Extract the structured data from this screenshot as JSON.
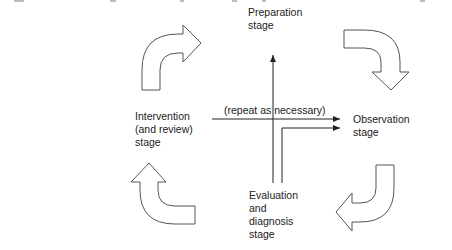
{
  "diagram": {
    "type": "cycle",
    "stages": {
      "preparation": "Preparation\nstage",
      "observation": "Observation\nstage",
      "evaluation": "Evaluation\nand\ndiagnosis\nstage",
      "intervention": "Intervention\n(and review)\nstage"
    },
    "center_note": "(repeat as necessary)",
    "arrows": [
      {
        "from": "intervention",
        "to": "preparation",
        "position": "top-left",
        "direction": "up-then-right"
      },
      {
        "from": "preparation",
        "to": "observation",
        "position": "top-right",
        "direction": "right-then-down"
      },
      {
        "from": "observation",
        "to": "evaluation",
        "position": "bottom-right",
        "direction": "down-then-left"
      },
      {
        "from": "evaluation",
        "to": "intervention",
        "position": "bottom-left",
        "direction": "left-then-up"
      }
    ],
    "colors": {
      "stroke": "#555555",
      "text": "#222222",
      "background": "#ffffff"
    }
  }
}
